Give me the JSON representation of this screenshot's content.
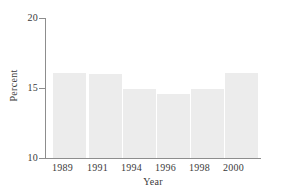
{
  "chart_data": {
    "type": "bar",
    "title": "",
    "subtitle": "",
    "xlabel": "Year",
    "ylabel": "Percent",
    "categories": [
      "1989",
      "1991",
      "1994",
      "1996",
      "1998",
      "2000"
    ],
    "values": [
      16.1,
      16.0,
      14.9,
      14.6,
      14.9,
      16.1
    ],
    "ylim": [
      10,
      20
    ],
    "yticks": [
      10,
      15,
      20
    ],
    "ytick_labels": [
      "10",
      "15",
      "20"
    ],
    "grid": false,
    "legend": null,
    "legend_position": "none",
    "bar_color": "#ececec",
    "axis_color": "#8d8d8d",
    "text_color": "#3a3a3a",
    "background": "#ffffff",
    "annotations": []
  },
  "axes": {
    "y": {
      "ticks": [
        {
          "label": "20",
          "value": 20
        },
        {
          "label": "15",
          "value": 15
        },
        {
          "label": "10",
          "value": 10
        }
      ],
      "title": "Percent"
    },
    "x": {
      "ticks": [
        {
          "label": "1989"
        },
        {
          "label": "1991"
        },
        {
          "label": "1994"
        },
        {
          "label": "1996"
        },
        {
          "label": "1998"
        },
        {
          "label": "2000"
        }
      ],
      "title": "Year"
    }
  }
}
